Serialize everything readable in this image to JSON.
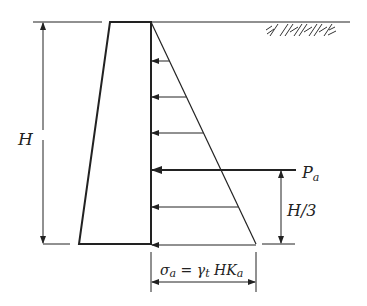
{
  "diagram": {
    "labels": {
      "height": "H",
      "resultant_force": "P",
      "resultant_force_sub": "a",
      "resultant_height": "H/3",
      "stress_sigma": "σ",
      "stress_sigma_sub": "a",
      "stress_eq": " = γ",
      "stress_gamma_sub": "t",
      "stress_hk": " HK",
      "stress_k_sub": "a"
    },
    "colors": {
      "line": "#222222",
      "background": "#ffffff"
    },
    "pressure_arrow_levels_y": [
      61,
      97,
      133,
      170,
      207,
      244
    ]
  }
}
